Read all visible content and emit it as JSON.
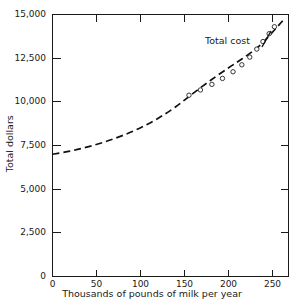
{
  "chart_data": {
    "type": "line",
    "title": "",
    "xlabel": "Thousands of pounds of milk per year",
    "ylabel": "Total dollars",
    "xlim": [
      0,
      268
    ],
    "ylim": [
      0,
      15000
    ],
    "xticks": [
      0,
      50,
      100,
      150,
      200,
      250
    ],
    "xtick_labels": [
      "0",
      "50",
      "100",
      "150",
      "200",
      "250"
    ],
    "yticks": [
      0,
      2500,
      5000,
      7500,
      10000,
      12500,
      15000
    ],
    "ytick_labels": [
      "0",
      "2,500",
      "5,000",
      "7,500",
      "10,000",
      "12,500",
      "15,000"
    ],
    "grid": false,
    "legend": "none",
    "series": [
      {
        "name": "Total cost",
        "annotation": "Total cost",
        "style": "dashed",
        "color": "#111111",
        "x": [
          0,
          20,
          40,
          60,
          80,
          100,
          120,
          140,
          160,
          180,
          200,
          215,
          230,
          240,
          250,
          258,
          264
        ],
        "y": [
          7000,
          7180,
          7420,
          7720,
          8080,
          8520,
          9060,
          9720,
          10500,
          11250,
          11950,
          12450,
          13000,
          13450,
          14000,
          14450,
          14780
        ],
        "markers": {
          "shape": "open-circle",
          "x": [
            155,
            168,
            181,
            193,
            205,
            215,
            224,
            232,
            239,
            246,
            252
          ],
          "y": [
            10380,
            10680,
            11000,
            11340,
            11720,
            12120,
            12560,
            13020,
            13450,
            13900,
            14300
          ]
        }
      }
    ]
  },
  "annotations": {
    "series_label": "Total cost"
  },
  "axes": {
    "x_title": "Thousands of pounds of milk per year",
    "y_title": "Total dollars"
  }
}
